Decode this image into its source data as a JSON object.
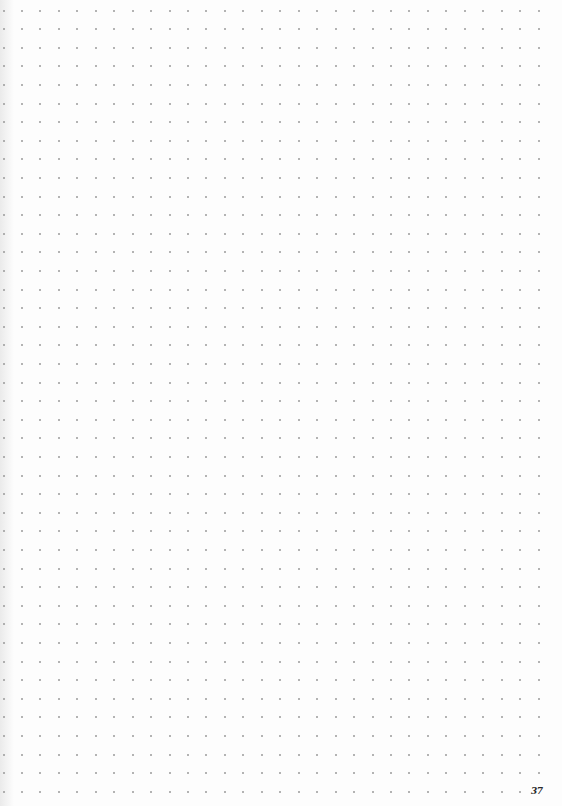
{
  "page": {
    "type": "dot-grid-notebook-page",
    "page_number": "37",
    "background_color": "#fdfdfd",
    "dot_color": "#9a9a9a"
  },
  "grid": {
    "origin_x": 3.5,
    "origin_y": 10.5,
    "pitch_x": 18.45,
    "pitch_y": 18.6,
    "columns": 30,
    "rows": 43
  }
}
